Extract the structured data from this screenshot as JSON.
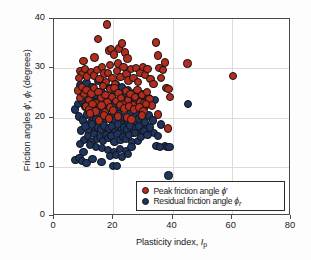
{
  "chart_data": {
    "type": "scatter",
    "title": "",
    "xlabel": "Plasticity index, Ip",
    "ylabel": "Friction angles ϕ', ϕr (degrees)",
    "xlim": [
      0,
      80
    ],
    "ylim": [
      0,
      40
    ],
    "xticks": [
      0,
      20,
      40,
      60,
      80
    ],
    "yticks": [
      0,
      10,
      20,
      30,
      40
    ],
    "grid": "major gridlines, light gray",
    "legend_position": "lower right, inside plot area",
    "colors": {
      "peak": "#B32D1E",
      "residual": "#1E3560",
      "marker_edge": "#121212",
      "frame": "#4a4a4a",
      "gridline": "#dcdcdc",
      "background": "#ffffff"
    },
    "series": [
      {
        "name": "peak",
        "legend_label": "Peak friction angle ϕ'",
        "color": "#B32D1E",
        "points": [
          [
            17.8,
            38.9
          ],
          [
            14.8,
            36.0
          ],
          [
            10.0,
            31.5
          ],
          [
            13.7,
            32.2
          ],
          [
            18.5,
            33.6
          ],
          [
            19.3,
            33.9
          ],
          [
            20.2,
            32.8
          ],
          [
            22.0,
            34.0
          ],
          [
            23.0,
            35.0
          ],
          [
            24.0,
            33.2
          ],
          [
            24.8,
            32.0
          ],
          [
            21.5,
            31.0
          ],
          [
            19.0,
            30.6
          ],
          [
            9.0,
            29.5
          ],
          [
            9.6,
            28.7
          ],
          [
            10.4,
            29.9
          ],
          [
            11.2,
            28.3
          ],
          [
            8.4,
            28.0
          ],
          [
            12.5,
            29.2
          ],
          [
            13.5,
            28.5
          ],
          [
            14.5,
            29.6
          ],
          [
            15.4,
            27.8
          ],
          [
            16.2,
            30.2
          ],
          [
            17.0,
            28.9
          ],
          [
            17.6,
            27.2
          ],
          [
            18.2,
            29.0
          ],
          [
            19.8,
            28.0
          ],
          [
            20.6,
            26.8
          ],
          [
            21.2,
            29.5
          ],
          [
            22.4,
            28.2
          ],
          [
            23.4,
            30.2
          ],
          [
            24.5,
            28.8
          ],
          [
            25.2,
            27.5
          ],
          [
            26.0,
            29.8
          ],
          [
            26.8,
            28.0
          ],
          [
            27.6,
            30.0
          ],
          [
            28.4,
            27.2
          ],
          [
            29.2,
            29.0
          ],
          [
            30.0,
            30.2
          ],
          [
            30.8,
            28.6
          ],
          [
            31.6,
            29.8
          ],
          [
            32.6,
            27.8
          ],
          [
            33.6,
            26.8
          ],
          [
            34.4,
            35.2
          ],
          [
            35.2,
            32.6
          ],
          [
            35.6,
            30.0
          ],
          [
            36.2,
            28.0
          ],
          [
            36.8,
            29.6
          ],
          [
            37.4,
            31.2
          ],
          [
            38.0,
            26.0
          ],
          [
            38.6,
            25.8
          ],
          [
            39.2,
            24.2
          ],
          [
            45.0,
            31.0
          ],
          [
            60.5,
            28.4
          ],
          [
            35.0,
            20.6
          ],
          [
            38.4,
            17.8
          ],
          [
            8.0,
            25.5
          ],
          [
            8.8,
            24.0
          ],
          [
            9.4,
            26.2
          ],
          [
            10.2,
            24.8
          ],
          [
            11.0,
            25.6
          ],
          [
            11.8,
            23.6
          ],
          [
            12.6,
            24.9
          ],
          [
            13.4,
            26.0
          ],
          [
            14.2,
            23.0
          ],
          [
            15.0,
            25.2
          ],
          [
            15.8,
            24.0
          ],
          [
            16.6,
            26.4
          ],
          [
            17.4,
            24.6
          ],
          [
            18.0,
            23.2
          ],
          [
            18.8,
            25.8
          ],
          [
            19.6,
            24.2
          ],
          [
            20.4,
            26.0
          ],
          [
            21.0,
            23.4
          ],
          [
            21.8,
            25.0
          ],
          [
            22.6,
            24.0
          ],
          [
            23.2,
            22.8
          ],
          [
            24.2,
            25.4
          ],
          [
            25.0,
            23.6
          ],
          [
            25.8,
            24.8
          ],
          [
            26.6,
            22.6
          ],
          [
            27.4,
            24.2
          ],
          [
            28.2,
            25.6
          ],
          [
            29.0,
            23.2
          ],
          [
            29.8,
            24.6
          ],
          [
            30.6,
            23.0
          ],
          [
            31.4,
            25.2
          ],
          [
            32.2,
            23.8
          ],
          [
            33.0,
            22.4
          ],
          [
            10.8,
            22.2
          ],
          [
            12.0,
            21.6
          ],
          [
            13.0,
            22.8
          ],
          [
            14.0,
            21.2
          ],
          [
            16.0,
            22.4
          ],
          [
            17.2,
            21.0
          ],
          [
            19.0,
            22.0
          ],
          [
            20.0,
            21.4
          ],
          [
            22.2,
            22.6
          ],
          [
            23.8,
            21.8
          ],
          [
            25.4,
            22.2
          ],
          [
            27.0,
            21.6
          ],
          [
            28.8,
            22.0
          ],
          [
            30.2,
            21.2
          ],
          [
            31.0,
            22.8
          ],
          [
            16.8,
            20.4
          ],
          [
            18.6,
            19.8
          ],
          [
            21.6,
            20.2
          ],
          [
            24.6,
            20.0
          ],
          [
            26.2,
            19.6
          ],
          [
            29.6,
            20.4
          ],
          [
            15.2,
            19.4
          ],
          [
            12.2,
            20.8
          ]
        ]
      },
      {
        "name": "residual",
        "legend_label": "Residual friction angle ϕr",
        "color": "#1E3560",
        "points": [
          [
            7.0,
            21.6
          ],
          [
            9.0,
            26.5
          ],
          [
            10.0,
            25.0
          ],
          [
            11.0,
            27.0
          ],
          [
            12.0,
            23.8
          ],
          [
            13.0,
            26.2
          ],
          [
            14.0,
            24.4
          ],
          [
            15.0,
            27.4
          ],
          [
            16.0,
            25.2
          ],
          [
            17.0,
            26.6
          ],
          [
            18.0,
            24.0
          ],
          [
            19.0,
            26.0
          ],
          [
            20.0,
            25.4
          ],
          [
            21.0,
            26.8
          ],
          [
            22.0,
            25.0
          ],
          [
            23.0,
            26.2
          ],
          [
            24.0,
            24.6
          ],
          [
            25.0,
            25.6
          ],
          [
            26.0,
            24.2
          ],
          [
            27.0,
            25.0
          ],
          [
            28.0,
            24.4
          ],
          [
            29.0,
            23.6
          ],
          [
            30.0,
            24.8
          ],
          [
            31.0,
            23.4
          ],
          [
            32.0,
            24.0
          ],
          [
            8.0,
            22.8
          ],
          [
            9.5,
            23.4
          ],
          [
            10.5,
            22.2
          ],
          [
            11.5,
            23.0
          ],
          [
            12.5,
            22.4
          ],
          [
            13.5,
            23.2
          ],
          [
            14.5,
            22.0
          ],
          [
            15.5,
            23.6
          ],
          [
            16.5,
            22.6
          ],
          [
            17.5,
            23.4
          ],
          [
            18.5,
            22.2
          ],
          [
            19.5,
            23.0
          ],
          [
            20.5,
            22.8
          ],
          [
            21.5,
            23.2
          ],
          [
            22.5,
            22.0
          ],
          [
            23.5,
            23.6
          ],
          [
            24.5,
            22.4
          ],
          [
            25.5,
            23.0
          ],
          [
            26.5,
            22.6
          ],
          [
            27.5,
            23.2
          ],
          [
            28.5,
            22.0
          ],
          [
            29.5,
            22.8
          ],
          [
            30.5,
            22.2
          ],
          [
            31.5,
            23.8
          ],
          [
            33.0,
            23.2
          ],
          [
            34.0,
            23.6
          ],
          [
            45.2,
            22.8
          ],
          [
            8.5,
            20.2
          ],
          [
            9.8,
            19.4
          ],
          [
            11.2,
            20.6
          ],
          [
            12.4,
            19.0
          ],
          [
            13.2,
            20.0
          ],
          [
            14.4,
            19.6
          ],
          [
            15.6,
            20.8
          ],
          [
            16.4,
            19.2
          ],
          [
            17.6,
            20.4
          ],
          [
            18.8,
            19.8
          ],
          [
            19.8,
            20.2
          ],
          [
            20.8,
            19.4
          ],
          [
            21.8,
            20.6
          ],
          [
            22.8,
            19.0
          ],
          [
            23.8,
            20.0
          ],
          [
            24.8,
            19.6
          ],
          [
            25.8,
            20.8
          ],
          [
            26.8,
            19.2
          ],
          [
            27.8,
            20.4
          ],
          [
            28.8,
            19.8
          ],
          [
            29.8,
            20.2
          ],
          [
            30.8,
            19.0
          ],
          [
            32.0,
            20.4
          ],
          [
            33.5,
            19.4
          ],
          [
            9.2,
            17.4
          ],
          [
            10.6,
            18.2
          ],
          [
            11.8,
            17.0
          ],
          [
            12.8,
            18.6
          ],
          [
            13.8,
            17.2
          ],
          [
            14.8,
            18.0
          ],
          [
            15.8,
            17.6
          ],
          [
            16.8,
            18.4
          ],
          [
            17.8,
            16.8
          ],
          [
            18.6,
            17.8
          ],
          [
            19.6,
            18.2
          ],
          [
            20.6,
            17.0
          ],
          [
            21.6,
            18.6
          ],
          [
            22.6,
            17.4
          ],
          [
            23.6,
            18.0
          ],
          [
            24.6,
            17.6
          ],
          [
            25.6,
            18.4
          ],
          [
            26.6,
            16.8
          ],
          [
            27.6,
            17.8
          ],
          [
            28.6,
            18.2
          ],
          [
            29.6,
            17.0
          ],
          [
            31.2,
            17.6
          ],
          [
            32.4,
            18.0
          ],
          [
            33.8,
            16.8
          ],
          [
            35.0,
            16.2
          ],
          [
            36.2,
            18.6
          ],
          [
            37.4,
            14.2
          ],
          [
            38.2,
            14.0
          ],
          [
            39.0,
            14.0
          ],
          [
            10.2,
            15.4
          ],
          [
            11.4,
            16.2
          ],
          [
            12.6,
            15.0
          ],
          [
            13.6,
            16.6
          ],
          [
            14.6,
            15.6
          ],
          [
            15.6,
            16.0
          ],
          [
            16.6,
            15.2
          ],
          [
            17.6,
            16.4
          ],
          [
            18.4,
            15.8
          ],
          [
            19.4,
            16.2
          ],
          [
            20.4,
            15.0
          ],
          [
            21.4,
            16.6
          ],
          [
            22.4,
            15.4
          ],
          [
            23.4,
            16.0
          ],
          [
            24.4,
            15.6
          ],
          [
            25.4,
            16.4
          ],
          [
            26.4,
            15.0
          ],
          [
            27.4,
            16.8
          ],
          [
            28.4,
            15.2
          ],
          [
            29.4,
            16.0
          ],
          [
            30.4,
            17.2
          ],
          [
            31.6,
            16.4
          ],
          [
            8.8,
            14.6
          ],
          [
            12.2,
            14.4
          ],
          [
            14.2,
            14.0
          ],
          [
            16.2,
            13.8
          ],
          [
            18.2,
            13.4
          ],
          [
            20.2,
            13.0
          ],
          [
            22.2,
            13.6
          ],
          [
            24.2,
            13.2
          ],
          [
            26.2,
            14.0
          ],
          [
            19.0,
            12.2
          ],
          [
            21.0,
            12.4
          ],
          [
            23.0,
            12.0
          ],
          [
            25.0,
            12.6
          ],
          [
            7.2,
            11.4
          ],
          [
            8.6,
            11.8
          ],
          [
            9.4,
            11.2
          ],
          [
            11.0,
            10.8
          ],
          [
            13.0,
            11.6
          ],
          [
            20.0,
            10.2
          ],
          [
            21.2,
            10.2
          ],
          [
            16.0,
            11.0
          ],
          [
            38.6,
            8.2
          ],
          [
            10.0,
            13.0
          ],
          [
            34.6,
            14.2
          ],
          [
            35.8,
            14.0
          ]
        ]
      }
    ]
  },
  "axes": {
    "x_tick_labels": [
      "0",
      "20",
      "40",
      "60",
      "80"
    ],
    "y_tick_labels": [
      "0",
      "10",
      "20",
      "30",
      "40"
    ],
    "x_title_main": "Plasticity index, ",
    "x_title_symbol": "I",
    "x_title_subscript": "p",
    "y_title_part1": "Friction angles ",
    "y_title_symbol1": "ϕ",
    "y_title_prime": "'",
    "y_title_comma": ", ",
    "y_title_symbol2": "ϕ",
    "y_title_subscript2": "r",
    "y_title_part2": " (degrees)"
  },
  "legend": {
    "items": [
      {
        "label_text": "Peak friction angle ",
        "label_symbol": "ϕ",
        "label_suffix": "'",
        "label_subscript": "",
        "color": "#B32D1E",
        "marker": "filled-circle-red"
      },
      {
        "label_text": "Residual friction angle ",
        "label_symbol": "ϕ",
        "label_suffix": "",
        "label_subscript": "r",
        "color": "#1E3560",
        "marker": "filled-circle-blue"
      }
    ]
  }
}
